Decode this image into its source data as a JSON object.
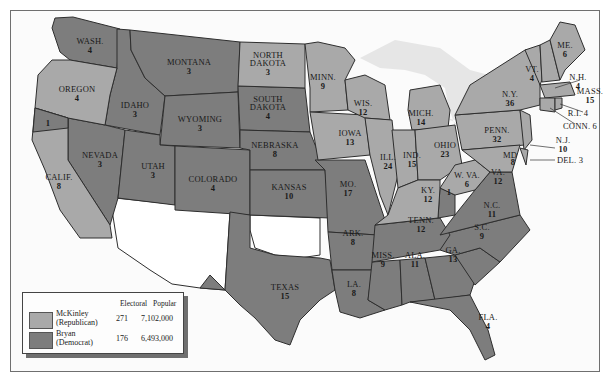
{
  "map": {
    "title": "Election of 1896",
    "colors": {
      "republican": "#a9a9a9",
      "democrat": "#7d7d7d",
      "territory": "#ffffff",
      "water": "#e9e9e9",
      "border": "#2e2e2e"
    },
    "states": [
      {
        "abbr": "WASH.",
        "ev": "4",
        "party": "democrat"
      },
      {
        "abbr": "OREGON",
        "ev": "4",
        "party": "republican"
      },
      {
        "abbr": "CALIF.",
        "ev": "8",
        "party": "republican",
        "split": {
          "democrat": "1"
        }
      },
      {
        "abbr": "NEVADA",
        "ev": "3",
        "party": "democrat"
      },
      {
        "abbr": "IDAHO",
        "ev": "3",
        "party": "democrat"
      },
      {
        "abbr": "MONTANA",
        "ev": "3",
        "party": "democrat"
      },
      {
        "abbr": "WYOMING",
        "ev": "3",
        "party": "democrat"
      },
      {
        "abbr": "UTAH",
        "ev": "3",
        "party": "democrat"
      },
      {
        "abbr": "COLORADO",
        "ev": "4",
        "party": "democrat"
      },
      {
        "abbr": "NORTH DAKOTA",
        "ev": "3",
        "party": "republican"
      },
      {
        "abbr": "SOUTH DAKOTA",
        "ev": "4",
        "party": "democrat"
      },
      {
        "abbr": "NEBRASKA",
        "ev": "8",
        "party": "democrat"
      },
      {
        "abbr": "KANSAS",
        "ev": "10",
        "party": "democrat"
      },
      {
        "abbr": "TEXAS",
        "ev": "15",
        "party": "democrat"
      },
      {
        "abbr": "MINN.",
        "ev": "9",
        "party": "republican"
      },
      {
        "abbr": "IOWA",
        "ev": "13",
        "party": "republican"
      },
      {
        "abbr": "MO.",
        "ev": "17",
        "party": "democrat"
      },
      {
        "abbr": "ARK.",
        "ev": "8",
        "party": "democrat"
      },
      {
        "abbr": "LA.",
        "ev": "8",
        "party": "democrat"
      },
      {
        "abbr": "WIS.",
        "ev": "12",
        "party": "republican"
      },
      {
        "abbr": "ILL.",
        "ev": "24",
        "party": "republican"
      },
      {
        "abbr": "MICH.",
        "ev": "14",
        "party": "republican"
      },
      {
        "abbr": "IND.",
        "ev": "15",
        "party": "republican"
      },
      {
        "abbr": "OHIO",
        "ev": "23",
        "party": "republican"
      },
      {
        "abbr": "KY.",
        "ev": "12",
        "party": "republican",
        "split": {
          "democrat": "1"
        }
      },
      {
        "abbr": "TENN.",
        "ev": "12",
        "party": "democrat"
      },
      {
        "abbr": "MISS.",
        "ev": "9",
        "party": "democrat"
      },
      {
        "abbr": "ALA.",
        "ev": "11",
        "party": "democrat"
      },
      {
        "abbr": "GA.",
        "ev": "13",
        "party": "democrat"
      },
      {
        "abbr": "FLA.",
        "ev": "4",
        "party": "democrat"
      },
      {
        "abbr": "S.C.",
        "ev": "9",
        "party": "democrat"
      },
      {
        "abbr": "N.C.",
        "ev": "11",
        "party": "democrat"
      },
      {
        "abbr": "VA.",
        "ev": "12",
        "party": "democrat"
      },
      {
        "abbr": "W. VA.",
        "ev": "6",
        "party": "republican"
      },
      {
        "abbr": "MD.",
        "ev": "8",
        "party": "republican"
      },
      {
        "abbr": "DEL.",
        "ev": "3",
        "party": "republican"
      },
      {
        "abbr": "PENN.",
        "ev": "32",
        "party": "republican"
      },
      {
        "abbr": "N.J.",
        "ev": "10",
        "party": "republican"
      },
      {
        "abbr": "N.Y.",
        "ev": "36",
        "party": "republican"
      },
      {
        "abbr": "CONN.",
        "ev": "6",
        "party": "republican"
      },
      {
        "abbr": "R.I.",
        "ev": "4",
        "party": "republican"
      },
      {
        "abbr": "MASS.",
        "ev": "15",
        "party": "republican"
      },
      {
        "abbr": "VT.",
        "ev": "4",
        "party": "republican"
      },
      {
        "abbr": "N.H.",
        "ev": "4",
        "party": "republican"
      },
      {
        "abbr": "ME.",
        "ev": "6",
        "party": "republican"
      }
    ],
    "split_labels": {
      "calif_dem": "1",
      "ky_dem": "1"
    }
  },
  "legend": {
    "col_electoral": "Electoral",
    "col_popular": "Popular",
    "rows": [
      {
        "name": "McKinley",
        "party": "(Republican)",
        "electoral": "271",
        "popular": "7,102,000",
        "color": "#a9a9a9"
      },
      {
        "name": "Bryan",
        "party": "(Democrat)",
        "electoral": "176",
        "popular": "6,493,000",
        "color": "#7d7d7d"
      }
    ]
  },
  "labels": {
    "wash": [
      "WASH.",
      "4"
    ],
    "oregon": [
      "OREGON",
      "4"
    ],
    "calif": [
      "CALIF.",
      "8"
    ],
    "nevada": [
      "NEVADA",
      "3"
    ],
    "idaho": [
      "IDAHO",
      "3"
    ],
    "montana": [
      "MONTANA",
      "3"
    ],
    "wyoming": [
      "WYOMING",
      "3"
    ],
    "utah": [
      "UTAH",
      "3"
    ],
    "colorado": [
      "COLORADO",
      "4"
    ],
    "ndak": [
      "NORTH",
      "DAKOTA",
      "3"
    ],
    "sdak": [
      "SOUTH",
      "DAKOTA",
      "4"
    ],
    "nebraska": [
      "NEBRASKA",
      "8"
    ],
    "kansas": [
      "KANSAS",
      "10"
    ],
    "texas": [
      "TEXAS",
      "15"
    ],
    "minn": [
      "MINN.",
      "9"
    ],
    "iowa": [
      "IOWA",
      "13"
    ],
    "mo": [
      "MO.",
      "17"
    ],
    "ark": [
      "ARK.",
      "8"
    ],
    "la": [
      "LA.",
      "8"
    ],
    "wis": [
      "WIS.",
      "12"
    ],
    "ill": [
      "ILL.",
      "24"
    ],
    "mich": [
      "MICH.",
      "14"
    ],
    "ind": [
      "IND.",
      "15"
    ],
    "ohio": [
      "OHIO",
      "23"
    ],
    "ky": [
      "KY.",
      "12"
    ],
    "tenn": [
      "TENN.",
      "12"
    ],
    "miss": [
      "MISS.",
      "9"
    ],
    "ala": [
      "ALA.",
      "11"
    ],
    "ga": [
      "GA.",
      "13"
    ],
    "fla": [
      "FLA.",
      "4"
    ],
    "sc": [
      "S.C.",
      "9"
    ],
    "nc": [
      "N.C.",
      "11"
    ],
    "va": [
      "VA.",
      "12"
    ],
    "wva": [
      "W. VA.",
      "6"
    ],
    "md": [
      "MD",
      "8"
    ],
    "del": "DEL. 3",
    "penn": [
      "PENN.",
      "32"
    ],
    "nj": [
      "N.J.",
      "10"
    ],
    "ny": [
      "N.Y.",
      "36"
    ],
    "conn": "CONN. 6",
    "ri": "R.I. 4",
    "mass": [
      "MASS.",
      "15"
    ],
    "vt": [
      "VT.",
      "4"
    ],
    "nh": [
      "N.H.",
      "4"
    ],
    "me": [
      "ME.",
      "6"
    ]
  }
}
